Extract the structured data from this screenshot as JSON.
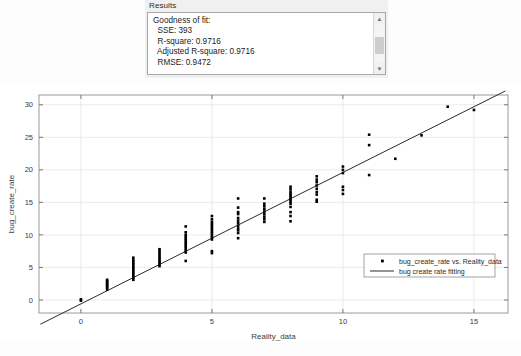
{
  "results_panel": {
    "title": "Results",
    "body_lines": [
      "Goodness of fit:",
      "  SSE: 393",
      "  R-square: 0.9716",
      "  Adjusted R-square: 0.9716",
      "  RMSE: 0.9472"
    ],
    "body_text": "Goodness of fit:\n  SSE: 393\n  R-square: 0.9716\n  Adjusted R-square: 0.9716\n  RMSE: 0.9472",
    "metrics": {
      "heading": "Goodness of fit:",
      "sse_label": "SSE:",
      "sse": "393",
      "r_square_label": "R-square:",
      "r_square": "0.9716",
      "adjusted_r_square_label": "Adjusted R-square:",
      "adjusted_r_square": "0.9716",
      "rmse_label": "RMSE:",
      "rmse": "0.9472"
    },
    "scrollbar": {
      "up_arrow": "▲",
      "down_arrow": "▼"
    }
  },
  "chart_data": {
    "type": "scatter",
    "title": "",
    "xlabel": "Reality_data",
    "ylabel": "bug_create_rate",
    "xlim": [
      -1.6,
      16.3
    ],
    "ylim": [
      -2.0,
      31.5
    ],
    "xticks": [
      0,
      5,
      10,
      15
    ],
    "yticks": [
      0,
      5,
      10,
      15,
      20,
      25,
      30
    ],
    "xticklabels": [
      "0",
      "5",
      "10",
      "15"
    ],
    "yticklabels": [
      "0",
      "5",
      "10",
      "15",
      "20",
      "25",
      "30"
    ],
    "grid": true,
    "legend_position": "lower right",
    "series": [
      {
        "name": "bug_create_rate vs. Reality_data",
        "type": "scatter",
        "marker": "point",
        "color": "#000000",
        "points": [
          [
            0,
            0.1
          ],
          [
            0,
            -0.1
          ],
          [
            1,
            1.6
          ],
          [
            1,
            1.9
          ],
          [
            1,
            2.1
          ],
          [
            1,
            2.3
          ],
          [
            1,
            2.5
          ],
          [
            1,
            2.7
          ],
          [
            1,
            2.9
          ],
          [
            1,
            3.1
          ],
          [
            2,
            3.1
          ],
          [
            2,
            3.4
          ],
          [
            2,
            3.7
          ],
          [
            2,
            4.0
          ],
          [
            2,
            4.3
          ],
          [
            2,
            4.6
          ],
          [
            2,
            4.9
          ],
          [
            2,
            5.2
          ],
          [
            2,
            5.5
          ],
          [
            2,
            5.8
          ],
          [
            2,
            6.1
          ],
          [
            2,
            6.5
          ],
          [
            3,
            5.2
          ],
          [
            3,
            5.5
          ],
          [
            3,
            5.8
          ],
          [
            3,
            6.0
          ],
          [
            3,
            6.3
          ],
          [
            3,
            6.6
          ],
          [
            3,
            6.9
          ],
          [
            3,
            7.2
          ],
          [
            3,
            7.5
          ],
          [
            3,
            7.8
          ],
          [
            4,
            6.0
          ],
          [
            4,
            7.3
          ],
          [
            4,
            7.6
          ],
          [
            4,
            7.9
          ],
          [
            4,
            8.2
          ],
          [
            4,
            8.5
          ],
          [
            4,
            8.8
          ],
          [
            4,
            9.1
          ],
          [
            4,
            9.4
          ],
          [
            4,
            9.7
          ],
          [
            4,
            10.0
          ],
          [
            4,
            10.4
          ],
          [
            4,
            11.3
          ],
          [
            5,
            7.2
          ],
          [
            5,
            7.5
          ],
          [
            5,
            9.3
          ],
          [
            5,
            9.6
          ],
          [
            5,
            9.9
          ],
          [
            5,
            10.2
          ],
          [
            5,
            10.5
          ],
          [
            5,
            10.8
          ],
          [
            5,
            11.1
          ],
          [
            5,
            11.4
          ],
          [
            5,
            11.7
          ],
          [
            5,
            12.0
          ],
          [
            5,
            12.4
          ],
          [
            5,
            12.9
          ],
          [
            6,
            9.5
          ],
          [
            6,
            10.3
          ],
          [
            6,
            10.7
          ],
          [
            6,
            11.0
          ],
          [
            6,
            11.4
          ],
          [
            6,
            11.8
          ],
          [
            6,
            12.2
          ],
          [
            6,
            12.6
          ],
          [
            6,
            13.2
          ],
          [
            6,
            13.5
          ],
          [
            6,
            14.2
          ],
          [
            6,
            15.6
          ],
          [
            7,
            12.0
          ],
          [
            7,
            12.4
          ],
          [
            7,
            12.8
          ],
          [
            7,
            13.2
          ],
          [
            7,
            13.6
          ],
          [
            7,
            14.0
          ],
          [
            7,
            14.4
          ],
          [
            7,
            14.8
          ],
          [
            7,
            15.6
          ],
          [
            8,
            12.1
          ],
          [
            8,
            12.9
          ],
          [
            8,
            13.5
          ],
          [
            8,
            14.3
          ],
          [
            8,
            14.8
          ],
          [
            8,
            15.1
          ],
          [
            8,
            15.4
          ],
          [
            8,
            15.7
          ],
          [
            8,
            16.0
          ],
          [
            8,
            16.3
          ],
          [
            8,
            16.6
          ],
          [
            8,
            17.0
          ],
          [
            8,
            17.4
          ],
          [
            9,
            15.1
          ],
          [
            9,
            15.4
          ],
          [
            9,
            16.2
          ],
          [
            9,
            16.6
          ],
          [
            9,
            17.1
          ],
          [
            9,
            17.6
          ],
          [
            9,
            18.1
          ],
          [
            9,
            18.5
          ],
          [
            9,
            19.0
          ],
          [
            10,
            16.3
          ],
          [
            10,
            16.9
          ],
          [
            10,
            17.4
          ],
          [
            10,
            19.5
          ],
          [
            10,
            20.0
          ],
          [
            10,
            20.5
          ],
          [
            11,
            19.2
          ],
          [
            11,
            23.8
          ],
          [
            11,
            25.4
          ],
          [
            12,
            21.7
          ],
          [
            13,
            25.3
          ],
          [
            14,
            29.7
          ],
          [
            15,
            29.2
          ]
        ]
      },
      {
        "name": "bug create rate fitting",
        "type": "line",
        "color": "#2b2b2b",
        "slope": 2.02,
        "intercept": -0.6,
        "x_from": -1.55,
        "x_to": 16.2
      }
    ],
    "legend": [
      {
        "label": "bug_create_rate vs. Reality_data",
        "marker": "point",
        "color": "#000000"
      },
      {
        "label": "bug create rate fitting",
        "marker": "line",
        "color": "#2b2b2b"
      }
    ]
  }
}
